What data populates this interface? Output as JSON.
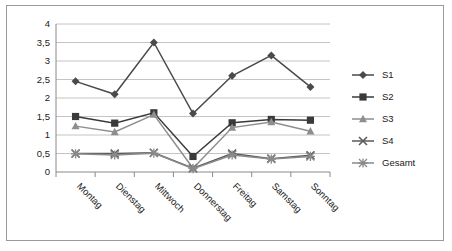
{
  "chart_data": {
    "type": "line",
    "title": "",
    "xlabel": "",
    "ylabel": "",
    "categories": [
      "Montag",
      "Dienstag",
      "Mittwoch",
      "Donnerstag",
      "Freitag",
      "Samstag",
      "Sonntag"
    ],
    "ylim": [
      0,
      4
    ],
    "ytick_step": 0.5,
    "ytick_labels": [
      "4",
      "3,5",
      "3",
      "2,5",
      "2",
      "1,5",
      "1",
      "0,5",
      "0"
    ],
    "ytick_values": [
      4,
      3.5,
      3,
      2.5,
      2,
      1.5,
      1,
      0.5,
      0
    ],
    "grid": "horizontal",
    "legend_position": "right",
    "series": [
      {
        "name": "S1",
        "marker": "diamond",
        "color": "#4a4a4a",
        "values": [
          2.45,
          2.1,
          3.5,
          1.58,
          2.6,
          3.15,
          2.3
        ]
      },
      {
        "name": "S2",
        "marker": "square",
        "color": "#3a3a3a",
        "values": [
          1.5,
          1.32,
          1.6,
          0.42,
          1.33,
          1.42,
          1.4
        ]
      },
      {
        "name": "S3",
        "marker": "triangle",
        "color": "#8e8e8e",
        "values": [
          1.24,
          1.08,
          1.55,
          0.1,
          1.2,
          1.35,
          1.1
        ]
      },
      {
        "name": "S4",
        "marker": "cross",
        "color": "#5a5a5a",
        "values": [
          0.5,
          0.5,
          0.52,
          0.1,
          0.5,
          0.36,
          0.45
        ]
      },
      {
        "name": "Gesamt",
        "marker": "star",
        "color": "#8a8a8a",
        "values": [
          0.49,
          0.46,
          0.51,
          0.09,
          0.46,
          0.35,
          0.42
        ]
      }
    ]
  }
}
